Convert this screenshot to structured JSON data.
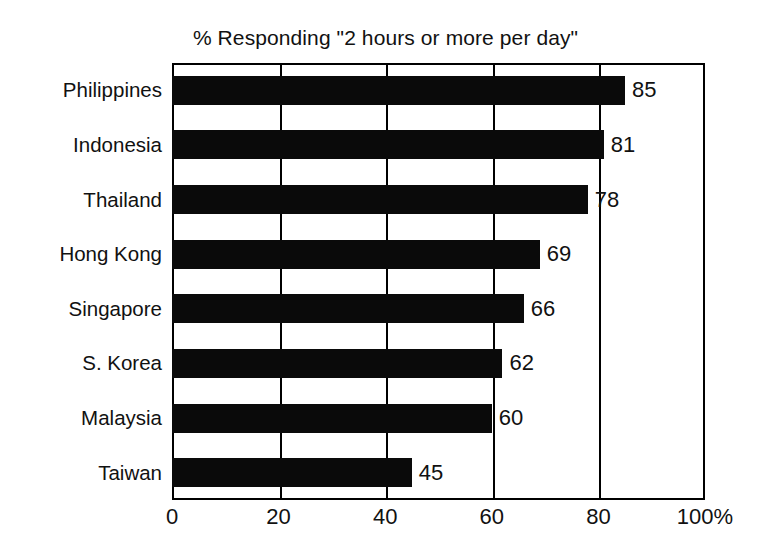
{
  "chart_data": {
    "type": "bar",
    "orientation": "horizontal",
    "title": "% Responding \"2 hours or more per day\"",
    "subtitle": "",
    "xlabel": "",
    "ylabel": "",
    "categories": [
      "Philippines",
      "Indonesia",
      "Thailand",
      "Hong Kong",
      "Singapore",
      "S. Korea",
      "Malaysia",
      "Taiwan"
    ],
    "values": [
      85,
      81,
      78,
      69,
      66,
      62,
      60,
      45
    ],
    "data_labels": [
      "85",
      "81",
      "78",
      "69",
      "66",
      "62",
      "60",
      "45"
    ],
    "xlim": [
      0,
      100
    ],
    "ylim": [
      0,
      8
    ],
    "xticks": [
      0,
      20,
      40,
      60,
      80,
      100
    ],
    "xticklabels": [
      "0",
      "20",
      "40",
      "60",
      "80",
      "100%"
    ],
    "grid": true,
    "grid_axis": "x",
    "legend": false,
    "legend_position": "none",
    "bar_color": "#0a0a0a",
    "background_color": "#ffffff",
    "frame_color": "#000000",
    "text_color": "#111111"
  },
  "caption": {
    "text": ""
  }
}
